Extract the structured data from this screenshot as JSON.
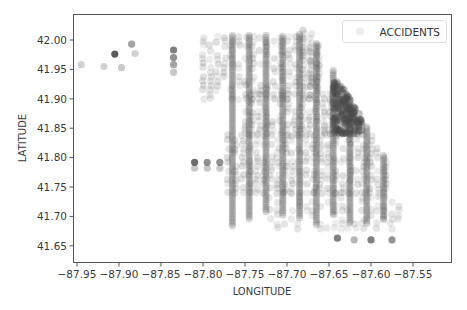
{
  "chart_data": {
    "type": "scatter",
    "title": "",
    "xlabel": "LONGITUDE",
    "ylabel": "LATITUDE",
    "xlim": [
      -87.96,
      -87.515
    ],
    "ylim": [
      41.628,
      42.04
    ],
    "xticks": [
      -87.95,
      -87.9,
      -87.85,
      -87.8,
      -87.75,
      -87.7,
      -87.65,
      -87.6,
      -87.55
    ],
    "xtick_labels": [
      "−87.95",
      "−87.90",
      "−87.85",
      "−87.80",
      "−87.75",
      "−87.70",
      "−87.65",
      "−87.60",
      "−87.55"
    ],
    "yticks": [
      41.65,
      41.7,
      41.75,
      41.8,
      41.85,
      41.9,
      41.95,
      42.0
    ],
    "ytick_labels": [
      "41.65",
      "41.70",
      "41.75",
      "41.80",
      "41.85",
      "41.90",
      "41.95",
      "42.00"
    ],
    "grid": false,
    "legend": {
      "position": "upper right",
      "entries": [
        "ACCIDENTS"
      ]
    },
    "series": [
      {
        "name": "ACCIDENTS",
        "color": "#4a4a4a",
        "alpha": 0.1,
        "marker": "o",
        "outliers": [
          {
            "x": -87.945,
            "y": 41.958,
            "alpha": 0.25
          },
          {
            "x": -87.918,
            "y": 41.955,
            "alpha": 0.25
          },
          {
            "x": -87.905,
            "y": 41.976,
            "alpha": 0.9
          },
          {
            "x": -87.897,
            "y": 41.953,
            "alpha": 0.3
          },
          {
            "x": -87.885,
            "y": 41.993,
            "alpha": 0.5
          },
          {
            "x": -87.881,
            "y": 41.977,
            "alpha": 0.25
          },
          {
            "x": -87.835,
            "y": 41.983,
            "alpha": 0.7
          },
          {
            "x": -87.835,
            "y": 41.97,
            "alpha": 0.6
          },
          {
            "x": -87.835,
            "y": 41.958,
            "alpha": 0.5
          },
          {
            "x": -87.835,
            "y": 41.945,
            "alpha": 0.3
          },
          {
            "x": -87.81,
            "y": 41.792,
            "alpha": 0.8
          },
          {
            "x": -87.795,
            "y": 41.792,
            "alpha": 0.6
          },
          {
            "x": -87.78,
            "y": 41.792,
            "alpha": 0.6
          },
          {
            "x": -87.81,
            "y": 41.782,
            "alpha": 0.3
          },
          {
            "x": -87.795,
            "y": 41.782,
            "alpha": 0.3
          },
          {
            "x": -87.78,
            "y": 41.782,
            "alpha": 0.3
          },
          {
            "x": -87.64,
            "y": 41.663,
            "alpha": 0.7
          },
          {
            "x": -87.6,
            "y": 41.66,
            "alpha": 0.7
          },
          {
            "x": -87.575,
            "y": 41.66,
            "alpha": 0.6
          },
          {
            "x": -87.62,
            "y": 41.66,
            "alpha": 0.4
          }
        ],
        "dense_regions": [
          {
            "x": [
              -87.8,
              -87.66
            ],
            "y": [
              41.9,
              42.01
            ],
            "density": 0.7
          },
          {
            "x": [
              -87.75,
              -87.63
            ],
            "y": [
              41.84,
              41.91
            ],
            "density": 0.8
          },
          {
            "x": [
              -87.645,
              -87.61
            ],
            "y": [
              41.84,
              41.92
            ],
            "density": 1.0
          },
          {
            "x": [
              -87.68,
              -87.655
            ],
            "y": [
              41.92,
              42.02
            ],
            "density": 1.0
          },
          {
            "x": [
              -87.77,
              -87.58
            ],
            "y": [
              41.74,
              41.84
            ],
            "density": 0.75
          },
          {
            "x": [
              -87.72,
              -87.56
            ],
            "y": [
              41.68,
              41.74
            ],
            "density": 0.45
          }
        ],
        "vertical_streaks_lon": [
          -87.765,
          -87.745,
          -87.725,
          -87.705,
          -87.685,
          -87.665,
          -87.645,
          -87.625,
          -87.605,
          -87.585
        ]
      }
    ]
  }
}
